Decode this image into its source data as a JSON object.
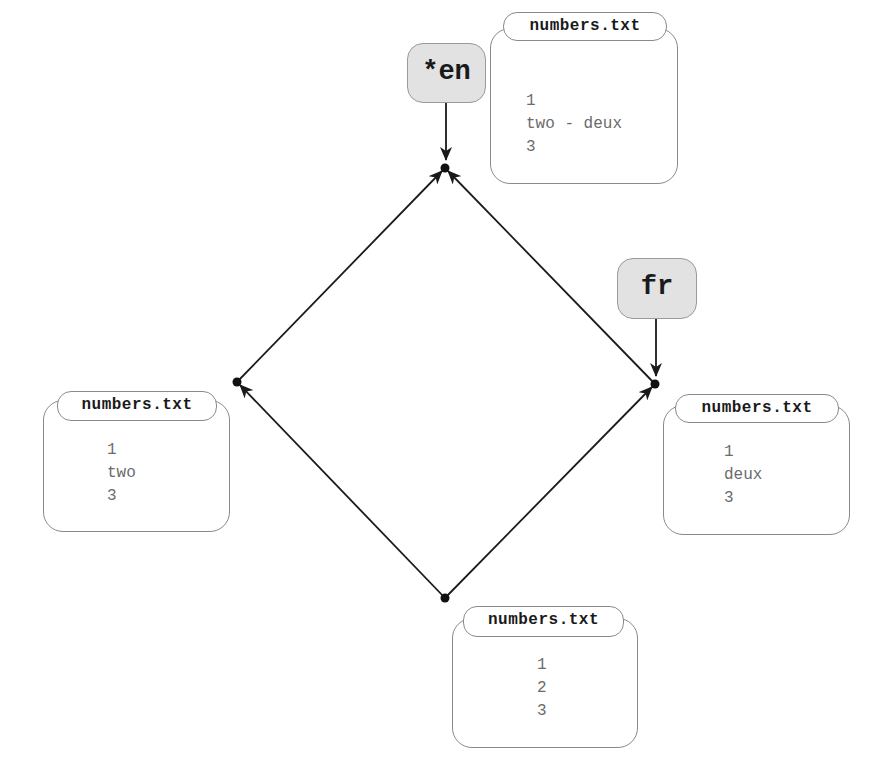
{
  "diagram": {
    "type": "commit-graph",
    "nodes": [
      {
        "id": "base",
        "x": 445,
        "y": 598
      },
      {
        "id": "left",
        "x": 237,
        "y": 382
      },
      {
        "id": "right",
        "x": 655,
        "y": 384
      },
      {
        "id": "merge",
        "x": 445,
        "y": 168
      }
    ],
    "edges": [
      {
        "from": "base",
        "to": "left"
      },
      {
        "from": "base",
        "to": "right"
      },
      {
        "from": "left",
        "to": "merge"
      },
      {
        "from": "right",
        "to": "merge"
      }
    ],
    "tags": [
      {
        "label": "*en",
        "points_to": "merge"
      },
      {
        "label": "fr",
        "points_to": "right"
      }
    ],
    "files": [
      {
        "node": "merge",
        "filename": "numbers.txt",
        "lines": [
          "1",
          "two - deux",
          "3"
        ]
      },
      {
        "node": "left",
        "filename": "numbers.txt",
        "lines": [
          "1",
          "two",
          "3"
        ]
      },
      {
        "node": "right",
        "filename": "numbers.txt",
        "lines": [
          "1",
          "deux",
          "3"
        ]
      },
      {
        "node": "base",
        "filename": "numbers.txt",
        "lines": [
          "1",
          "2",
          "3"
        ]
      }
    ]
  },
  "tags": {
    "en": "*en",
    "fr": "fr"
  },
  "files": {
    "merge": {
      "filename": "numbers.txt",
      "content": "1\ntwo - deux\n3"
    },
    "left": {
      "filename": "numbers.txt",
      "content": "1\ntwo\n3"
    },
    "right": {
      "filename": "numbers.txt",
      "content": "1\ndeux\n3"
    },
    "base": {
      "filename": "numbers.txt",
      "content": "1\n2\n3"
    }
  },
  "colors": {
    "edge": "#1a1a1a",
    "node": "#111111",
    "tag_fill": "#e2e2e2",
    "box_border": "#8a8a8a",
    "file_text": "#6b6b6b"
  }
}
